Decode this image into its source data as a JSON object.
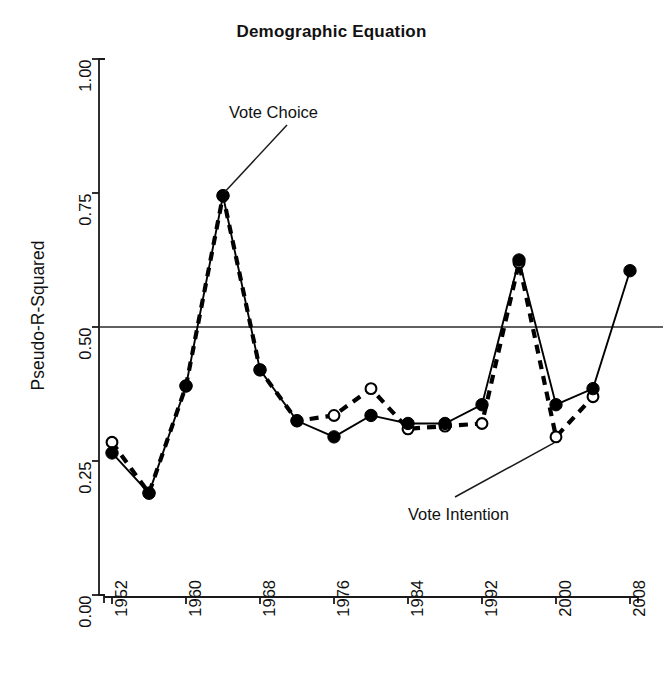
{
  "chart_data": {
    "type": "line",
    "title": "Demographic Equation",
    "xlabel": "",
    "ylabel": "Pseudo-R-Squared",
    "x": [
      1952,
      1956,
      1960,
      1964,
      1968,
      1972,
      1976,
      1980,
      1984,
      1988,
      1992,
      1996,
      2000,
      2004,
      2008
    ],
    "xlim": [
      1950,
      2010
    ],
    "ylim": [
      0.0,
      1.0
    ],
    "xticks": [
      1952,
      1960,
      1968,
      1976,
      1984,
      1992,
      2000,
      2008
    ],
    "xtick_labels": [
      "1952",
      "1960",
      "1968",
      "1976",
      "1984",
      "1992",
      "2000",
      "2008"
    ],
    "yticks": [
      0.0,
      0.25,
      0.5,
      0.75,
      1.0
    ],
    "ytick_labels": [
      "0.00",
      "0.25",
      "0.50",
      "0.75",
      "1.00"
    ],
    "grid": false,
    "reference_line": {
      "y": 0.5,
      "orientation": "horizontal"
    },
    "legend_position": "inline-annotation",
    "series": [
      {
        "name": "Vote Choice",
        "marker": "filled-circle",
        "line_style": "solid",
        "color": "#000000",
        "values": [
          0.265,
          0.19,
          0.39,
          0.745,
          0.42,
          0.325,
          0.295,
          0.335,
          0.32,
          0.32,
          0.355,
          0.625,
          0.355,
          0.385,
          0.605
        ]
      },
      {
        "name": "Vote Intention",
        "marker": "open-circle",
        "line_style": "dashed",
        "color": "#000000",
        "values": [
          0.285,
          0.19,
          0.39,
          0.745,
          0.42,
          0.325,
          0.335,
          0.385,
          0.31,
          0.315,
          0.32,
          0.62,
          0.295,
          0.37,
          null
        ]
      }
    ],
    "annotations": [
      {
        "text": "Vote Choice",
        "points_to_year": 1964,
        "points_to_value": 0.745
      },
      {
        "text": "Vote Intention",
        "points_to_year": 2000,
        "points_to_value": 0.295
      }
    ]
  }
}
